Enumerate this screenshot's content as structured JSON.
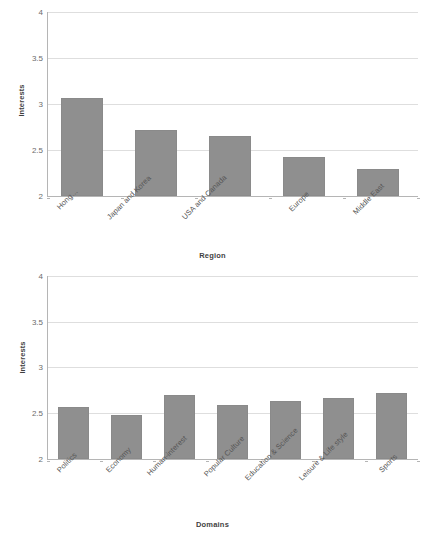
{
  "chart_data": [
    {
      "type": "bar",
      "title": "",
      "categories": [
        "Hong…",
        "Japan and Korea",
        "USA and Canada",
        "Europe",
        "Middle East"
      ],
      "values": [
        3.06,
        2.72,
        2.65,
        2.42,
        2.29
      ],
      "xlabel": "Region",
      "ylabel": "Interests",
      "ylim": [
        2,
        4
      ],
      "yticks": [
        "2",
        "2.5",
        "3",
        "3.5",
        "4"
      ],
      "ytick_values": [
        2,
        2.5,
        3,
        3.5,
        4
      ],
      "grid": true,
      "legend": false,
      "bar_color": "#8f8f8f"
    },
    {
      "type": "bar",
      "title": "",
      "categories": [
        "Politics",
        "Economy",
        "Human-interest",
        "Popular Culture",
        "Education & Science",
        "Leisure & Life style",
        "Sports"
      ],
      "values": [
        2.57,
        2.48,
        2.7,
        2.59,
        2.63,
        2.67,
        2.72
      ],
      "xlabel": "Domains",
      "ylabel": "Interests",
      "ylim": [
        2,
        4
      ],
      "yticks": [
        "2",
        "2.5",
        "3",
        "3.5",
        "4"
      ],
      "ytick_values": [
        2,
        2.5,
        3,
        3.5,
        4
      ],
      "grid": true,
      "legend": false,
      "bar_color": "#8f8f8f"
    }
  ],
  "colors": {
    "bar": "#8f8f8f",
    "grid": "#dedede",
    "axis": "#b5b5b5",
    "text": "#555555",
    "background": "#ffffff"
  }
}
